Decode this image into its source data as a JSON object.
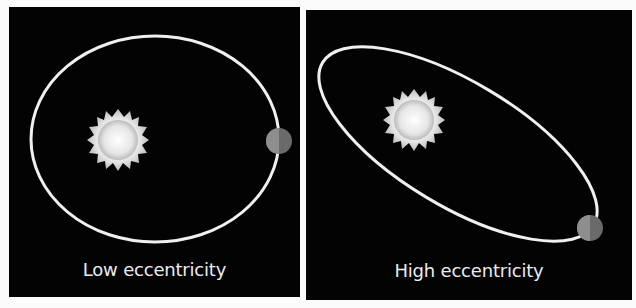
{
  "panels": [
    {
      "label": "Low eccentricity",
      "orbit": {
        "cx": 146,
        "cy": 132,
        "rx": 124,
        "ry": 103,
        "rotate": 0
      },
      "sun": {
        "cx": 109,
        "cy": 133,
        "r": 27
      },
      "planet": {
        "cx": 270,
        "cy": 134,
        "r": 13
      }
    },
    {
      "label": "High eccentricity",
      "orbit": {
        "cx": 152,
        "cy": 134,
        "rx": 158,
        "ry": 62,
        "rotate": 31
      },
      "sun": {
        "cx": 108,
        "cy": 110,
        "r": 27
      },
      "planet": {
        "cx": 284,
        "cy": 218,
        "r": 13
      }
    }
  ],
  "colors": {
    "background": "#030303",
    "orbit": "#f0f0f0",
    "sun": "#f4f4f4",
    "text": "#ececec"
  }
}
